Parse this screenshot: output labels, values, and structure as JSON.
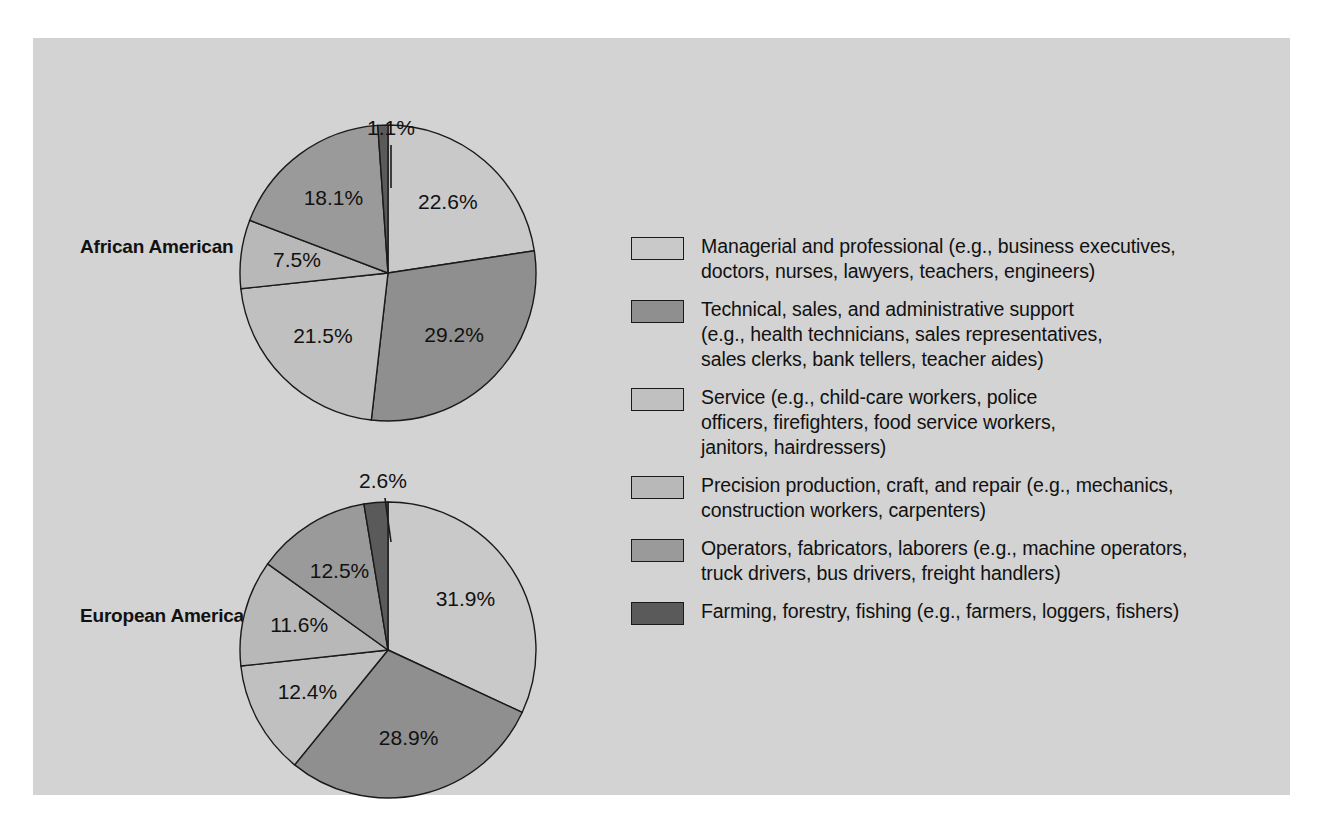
{
  "figure": {
    "background_color": "#d3d3d3",
    "page_color": "#ffffff"
  },
  "groups": [
    {
      "id": "african",
      "label": "African\nAmerican"
    },
    {
      "id": "european",
      "label": "European\nAmerican"
    }
  ],
  "palette": {
    "managerial": "#c9c9c9",
    "technical": "#8f8f8f",
    "service": "#c0c0c0",
    "precision": "#b8b8b8",
    "operators": "#9a9a9a",
    "farming": "#5a5a5a"
  },
  "legend": {
    "items": [
      {
        "key": "managerial",
        "color": "#c9c9c9",
        "text": "Managerial and professional (e.g., business executives,\ndoctors, nurses, lawyers, teachers, engineers)"
      },
      {
        "key": "technical",
        "color": "#8f8f8f",
        "text": "Technical, sales, and administrative support\n(e.g., health technicians, sales representatives,\nsales clerks, bank tellers, teacher aides)"
      },
      {
        "key": "service",
        "color": "#c0c0c0",
        "text": "Service (e.g., child-care workers, police\nofficers, firefighters, food service workers,\njanitors, hairdressers)"
      },
      {
        "key": "precision",
        "color": "#b8b8b8",
        "text": "Precision production, craft, and repair (e.g., mechanics,\nconstruction workers, carpenters)"
      },
      {
        "key": "operators",
        "color": "#9a9a9a",
        "text": "Operators, fabricators, laborers (e.g., machine operators,\ntruck drivers, bus drivers, freight handlers)"
      },
      {
        "key": "farming",
        "color": "#5a5a5a",
        "text": "Farming, forestry, fishing (e.g., farmers, loggers, fishers)"
      }
    ]
  },
  "chart_data": [
    {
      "type": "pie",
      "title": "African American",
      "categories": [
        "Managerial and professional",
        "Technical, sales, and administrative support",
        "Service",
        "Precision production, craft, and repair",
        "Operators, fabricators, laborers",
        "Farming, forestry, fishing"
      ],
      "values": [
        22.6,
        29.2,
        21.5,
        7.5,
        18.1,
        1.1
      ],
      "labels": [
        "22.6%",
        "29.2%",
        "21.5%",
        "7.5%",
        "18.1%",
        "1.1%"
      ],
      "colors": [
        "#c9c9c9",
        "#8f8f8f",
        "#c0c0c0",
        "#b8b8b8",
        "#9a9a9a",
        "#5a5a5a"
      ],
      "units": "percent",
      "start_angle_deg": 0,
      "direction": "clockwise",
      "legend_position": "right"
    },
    {
      "type": "pie",
      "title": "European American",
      "categories": [
        "Managerial and professional",
        "Technical, sales, and administrative support",
        "Service",
        "Precision production, craft, and repair",
        "Operators, fabricators, laborers",
        "Farming, forestry, fishing"
      ],
      "values": [
        31.9,
        28.9,
        12.4,
        11.6,
        12.5,
        2.6
      ],
      "labels": [
        "31.9%",
        "28.9%",
        "12.4%",
        "11.6%",
        "12.5%",
        "2.6%"
      ],
      "colors": [
        "#c9c9c9",
        "#8f8f8f",
        "#c0c0c0",
        "#b8b8b8",
        "#9a9a9a",
        "#5a5a5a"
      ],
      "units": "percent",
      "start_angle_deg": 0,
      "direction": "clockwise",
      "legend_position": "right"
    }
  ]
}
